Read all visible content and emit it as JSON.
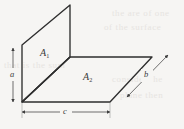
{
  "figure": {
    "background_color": "#f6f5f3",
    "stroke_color": "#2e2e2e",
    "dimension_color": "#4a4a4a",
    "labels": {
      "area_1": "A",
      "area_1_sub": "1",
      "area_2": "A",
      "area_2_sub": "2",
      "dim_a": "a",
      "dim_b": "b",
      "dim_c": "c"
    },
    "geometry": {
      "plane_a1_points": "22,45 70,5 70,57 22,102",
      "plane_a2_points": "22,102 70,57 152,57 110,102",
      "shared_edge": "22,102 70,57",
      "vertical_edge": "70,5 70,57",
      "dim_a_line": {
        "x": 13,
        "y_top": 48,
        "y_bottom": 102
      },
      "dim_c_line": {
        "y": 112,
        "x_left": 22,
        "x_right": 110
      },
      "dim_b_line": {
        "x1": 127,
        "y1": 97,
        "x2": 168,
        "y2": 55
      }
    },
    "ghost_text": [
      "the are of one",
      "of the surface",
      "that is the sum",
      "consider the",
      "plane then"
    ]
  }
}
